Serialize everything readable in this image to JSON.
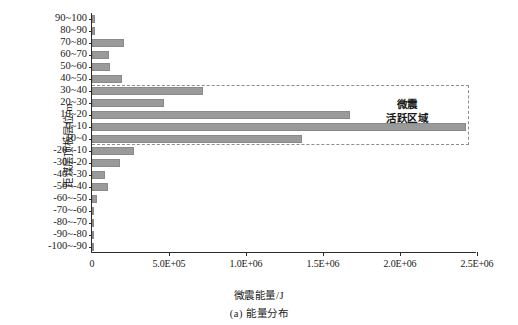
{
  "chart_data": {
    "type": "bar",
    "orientation": "horizontal",
    "title": "",
    "caption": "(a) 能量分布",
    "xlabel": "微震能量/J",
    "ylabel": "距煤层顶板层位/m",
    "xlim": [
      0,
      2500000
    ],
    "xticks": [
      0,
      500000,
      1000000,
      1500000,
      2000000,
      2500000
    ],
    "xtick_labels": [
      "0",
      "5.0E+05",
      "1.0E+06",
      "1.5E+06",
      "2.0E+06",
      "2.5E+06"
    ],
    "grid": false,
    "legend": "none",
    "bar_color": "#9a9a9a",
    "categories": [
      "90~100",
      "80~90",
      "70~80",
      "60~70",
      "50~60",
      "40~50",
      "30~40",
      "20~30",
      "10~20",
      "0~10",
      "-10~0",
      "-20~-10",
      "-30~-20",
      "-40~-30",
      "-50~-40",
      "-60~-50",
      "-70~-60",
      "-80~-70",
      "-90~-80",
      "-100~-90"
    ],
    "values": [
      20000,
      18000,
      205000,
      108000,
      120000,
      195000,
      720000,
      470000,
      1675000,
      2430000,
      1365000,
      270000,
      185000,
      85000,
      105000,
      30000,
      15000,
      12000,
      8000,
      4000
    ],
    "annotations": [
      {
        "text_line1": "微震",
        "text_line2": "活跃区域",
        "spans_categories": [
          "30~40",
          "-10~0"
        ],
        "style": "dashed-bracket"
      }
    ]
  },
  "annotation": {
    "line1": "微震",
    "line2": "活跃区域"
  }
}
